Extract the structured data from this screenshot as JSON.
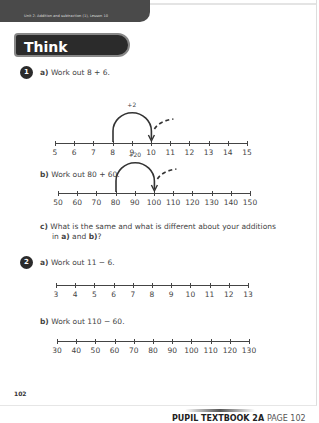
{
  "header": {
    "breadcrumb": "Unit 2: Addition and subtraction (1), Lesson 10"
  },
  "section_title": "Think together",
  "questions": [
    {
      "number": "1",
      "parts": [
        {
          "label": "a)",
          "text": "Work out 8 + 6.",
          "number_line": {
            "ticks": [
              "5",
              "6",
              "7",
              "8",
              "9",
              "10",
              "11",
              "12",
              "13",
              "14",
              "15"
            ],
            "jump": {
              "from": "8",
              "to": "10",
              "label": "+2"
            },
            "continuation_arrow": true
          }
        },
        {
          "label": "b)",
          "text": "Work out 80 + 60.",
          "number_line": {
            "ticks": [
              "50",
              "60",
              "70",
              "80",
              "90",
              "100",
              "110",
              "120",
              "130",
              "140",
              "150"
            ],
            "jump": {
              "from": "80",
              "to": "100",
              "label": "+20"
            },
            "continuation_arrow": true
          }
        },
        {
          "label": "c)",
          "text_line1": "What is the same and what is different about your additions",
          "text_line2_pre": "in ",
          "text_line2_a": "a)",
          "text_line2_mid": " and ",
          "text_line2_b": "b)",
          "text_line2_post": "?"
        }
      ]
    },
    {
      "number": "2",
      "parts": [
        {
          "label": "a)",
          "text": "Work out 11 − 6.",
          "number_line": {
            "ticks": [
              "3",
              "4",
              "5",
              "6",
              "7",
              "8",
              "9",
              "10",
              "11",
              "12",
              "13"
            ]
          }
        },
        {
          "label": "b)",
          "text": "Work out 110 − 60.",
          "number_line": {
            "ticks": [
              "30",
              "40",
              "50",
              "60",
              "70",
              "80",
              "90",
              "100",
              "110",
              "120",
              "130"
            ]
          }
        }
      ]
    }
  ],
  "page_number": "102",
  "footer": {
    "book": "PUPIL TEXTBOOK 2A",
    "page": "PAGE 102"
  }
}
